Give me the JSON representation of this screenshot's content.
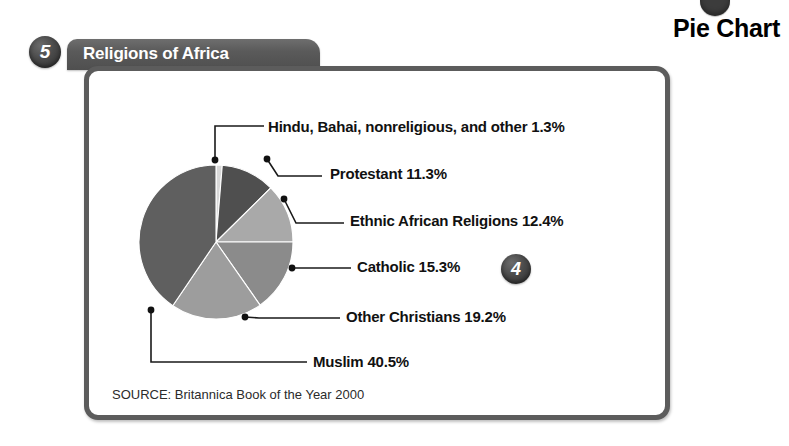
{
  "header": {
    "section_number": "5",
    "tab_title": "Religions of Africa",
    "page_title": "Pie Chart",
    "top_badge_icon": "circle-badge-icon"
  },
  "annotation_badge": {
    "number": "4"
  },
  "source": "SOURCE: Britannica Book of the Year 2000",
  "chart_data": {
    "type": "pie",
    "title": "Religions of Africa",
    "xlabel": "",
    "ylabel": "",
    "units": "percent",
    "legend_position": "callout-labels",
    "grid": false,
    "source": "SOURCE: Britannica Book of the Year 2000",
    "categories": [
      "Hindu, Bahai, nonreligious, and other",
      "Protestant",
      "Ethnic African Religions",
      "Catholic",
      "Other Christians",
      "Muslim"
    ],
    "values": [
      1.3,
      11.3,
      12.4,
      15.3,
      19.2,
      40.5
    ],
    "labels": [
      "Hindu, Bahai, nonreligious, and other 1.3%",
      "Protestant 11.3%",
      "Ethnic African Religions 12.4%",
      "Catholic 15.3%",
      "Other Christians 19.2%",
      "Muslim 40.5%"
    ],
    "colors": [
      "#d8d8d8",
      "#4f4f4f",
      "#a9a9a9",
      "#8b8b8b",
      "#9d9d9d",
      "#5f5f5f"
    ]
  }
}
